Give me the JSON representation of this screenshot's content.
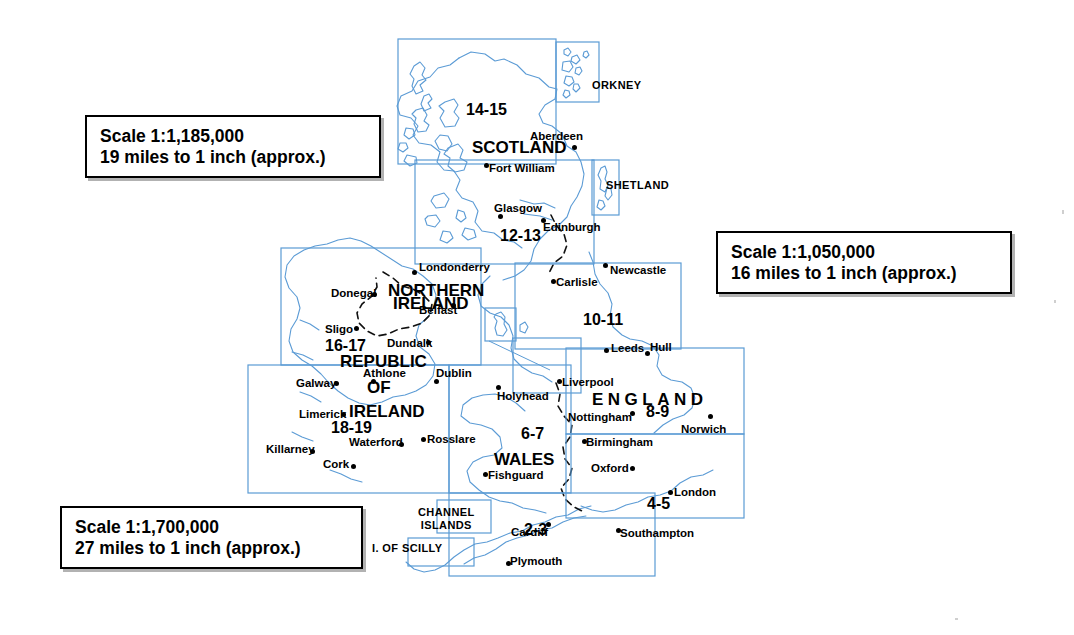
{
  "document": {
    "title": "Road Atlas Map Index — Britain and Ireland",
    "background_color": "#ffffff",
    "grid_color": "#5a9bd4",
    "coast_color": "#5b9bd5",
    "land_color": "#ffffff",
    "text_color": "#000000"
  },
  "scale_boxes": [
    {
      "name": "scale-box-scotland",
      "line1": "Scale 1:1,185,000",
      "line2": "19 miles to 1 inch (approx.)",
      "x": 85,
      "y": 115,
      "w": 296,
      "h": 63
    },
    {
      "name": "scale-box-england",
      "line1": "Scale 1:1,050,000",
      "line2": "16 miles to 1 inch (approx.)",
      "x": 716,
      "y": 231,
      "w": 296,
      "h": 63
    },
    {
      "name": "scale-box-ireland",
      "line1": "Scale 1:1,700,000",
      "line2": "27 miles to 1 inch (approx.)",
      "x": 60,
      "y": 506,
      "w": 303,
      "h": 63
    }
  ],
  "sheet_numbers": [
    {
      "label": "14-15",
      "x": 466,
      "y": 102
    },
    {
      "label": "12-13",
      "x": 500,
      "y": 228
    },
    {
      "label": "10-11",
      "x": 583,
      "y": 312
    },
    {
      "label": "16-17",
      "x": 325,
      "y": 338
    },
    {
      "label": "18-19",
      "x": 331,
      "y": 420
    },
    {
      "label": "8-9",
      "x": 646,
      "y": 404
    },
    {
      "label": "6-7",
      "x": 521,
      "y": 426
    },
    {
      "label": "4-5",
      "x": 647,
      "y": 496
    },
    {
      "label": "2-3",
      "x": 524,
      "y": 522
    }
  ],
  "country_labels": [
    {
      "label": "SCOTLAND",
      "x": 472,
      "y": 139,
      "wide": false
    },
    {
      "label": "NORTHERN",
      "x": 388,
      "y": 282,
      "wide": false
    },
    {
      "label": "IRELAND",
      "x": 393,
      "y": 295,
      "wide": false
    },
    {
      "label": "REPUBLIC",
      "x": 340,
      "y": 353,
      "wide": false
    },
    {
      "label": "OF",
      "x": 367,
      "y": 379,
      "wide": false
    },
    {
      "label": "IRELAND",
      "x": 349,
      "y": 403,
      "wide": false
    },
    {
      "label": "ENGLAND",
      "x": 592,
      "y": 391,
      "wide": true
    },
    {
      "label": "WALES",
      "x": 494,
      "y": 451,
      "wide": false
    }
  ],
  "inset_labels": [
    {
      "label": "ORKNEY",
      "x": 592,
      "y": 80,
      "lines": 1
    },
    {
      "label": "SHETLAND",
      "x": 606,
      "y": 180,
      "lines": 1
    },
    {
      "label": "CHANNEL\nISLANDS",
      "x": 418,
      "y": 506,
      "lines": 2
    },
    {
      "label": "I. OF SCILLY",
      "x": 372,
      "y": 543,
      "lines": 1
    }
  ],
  "cities": [
    {
      "name": "Aberdeen",
      "lx": 530,
      "ly": 131,
      "dx": 572,
      "dy": 145
    },
    {
      "name": "Fort William",
      "lx": 489,
      "ly": 163,
      "dx": 484,
      "dy": 163
    },
    {
      "name": "Glasgow",
      "lx": 494,
      "ly": 203,
      "dx": 498,
      "dy": 214
    },
    {
      "name": "Edinburgh",
      "lx": 543,
      "ly": 222,
      "dx": 541,
      "dy": 218
    },
    {
      "name": "Newcastle",
      "lx": 610,
      "ly": 265,
      "dx": 603,
      "dy": 263
    },
    {
      "name": "Carlisle",
      "lx": 556,
      "ly": 277,
      "dx": 551,
      "dy": 279
    },
    {
      "name": "Leeds",
      "lx": 611,
      "ly": 343,
      "dx": 604,
      "dy": 348
    },
    {
      "name": "Hull",
      "lx": 650,
      "ly": 342,
      "dx": 645,
      "dy": 351
    },
    {
      "name": "Londonderry",
      "lx": 419,
      "ly": 262,
      "dx": 412,
      "dy": 270
    },
    {
      "name": "Donegal",
      "lx": 331,
      "ly": 288,
      "dx": 372,
      "dy": 292
    },
    {
      "name": "Belfast",
      "lx": 419,
      "ly": 305,
      "dx": 451,
      "dy": 303
    },
    {
      "name": "Sligo",
      "lx": 325,
      "ly": 324,
      "dx": 354,
      "dy": 326
    },
    {
      "name": "Dundalk",
      "lx": 387,
      "ly": 338,
      "dx": 426,
      "dy": 340
    },
    {
      "name": "Athlone",
      "lx": 363,
      "ly": 368,
      "dx": 371,
      "dy": 379
    },
    {
      "name": "Dublin",
      "lx": 436,
      "ly": 368,
      "dx": 434,
      "dy": 379
    },
    {
      "name": "Galway",
      "lx": 296,
      "ly": 378,
      "dx": 334,
      "dy": 381
    },
    {
      "name": "Limerick",
      "lx": 299,
      "ly": 409,
      "dx": 341,
      "dy": 412
    },
    {
      "name": "Waterford",
      "lx": 349,
      "ly": 437,
      "dx": 399,
      "dy": 442
    },
    {
      "name": "Rosslare",
      "lx": 427,
      "ly": 434,
      "dx": 421,
      "dy": 437
    },
    {
      "name": "Killarney",
      "lx": 266,
      "ly": 444,
      "dx": 310,
      "dy": 449
    },
    {
      "name": "Cork",
      "lx": 323,
      "ly": 459,
      "dx": 351,
      "dy": 464
    },
    {
      "name": "Holyhead",
      "lx": 497,
      "ly": 391,
      "dx": 496,
      "dy": 385
    },
    {
      "name": "Liverpool",
      "lx": 562,
      "ly": 377,
      "dx": 557,
      "dy": 379
    },
    {
      "name": "Nottingham",
      "lx": 568,
      "ly": 412,
      "dx": 630,
      "dy": 411
    },
    {
      "name": "Birmingham",
      "lx": 586,
      "ly": 437,
      "dx": 582,
      "dy": 439
    },
    {
      "name": "Norwich",
      "lx": 681,
      "ly": 424,
      "dx": 708,
      "dy": 414
    },
    {
      "name": "Oxford",
      "lx": 591,
      "ly": 463,
      "dx": 630,
      "dy": 466
    },
    {
      "name": "Fishguard",
      "lx": 488,
      "ly": 470,
      "dx": 483,
      "dy": 472
    },
    {
      "name": "London",
      "lx": 674,
      "ly": 487,
      "dx": 668,
      "dy": 490
    },
    {
      "name": "Cardiff",
      "lx": 511,
      "ly": 527,
      "dx": 546,
      "dy": 522
    },
    {
      "name": "Southampton",
      "lx": 620,
      "ly": 528,
      "dx": 616,
      "dy": 528
    },
    {
      "name": "Plymouth",
      "lx": 510,
      "ly": 556,
      "dx": 506,
      "dy": 561
    }
  ],
  "grid_boxes": [
    {
      "name": "box-14-15",
      "x": 398,
      "y": 39,
      "w": 158,
      "h": 125
    },
    {
      "name": "box-orkney-inset",
      "x": 556,
      "y": 42,
      "w": 43,
      "h": 60
    },
    {
      "name": "box-12-13",
      "x": 415,
      "y": 160,
      "w": 179,
      "h": 104
    },
    {
      "name": "box-shetland-inset",
      "x": 592,
      "y": 160,
      "w": 27,
      "h": 55
    },
    {
      "name": "box-10-11",
      "x": 515,
      "y": 263,
      "w": 166,
      "h": 86
    },
    {
      "name": "box-16-17",
      "x": 281,
      "y": 248,
      "w": 200,
      "h": 117
    },
    {
      "name": "box-18-19",
      "x": 248,
      "y": 365,
      "w": 201,
      "h": 128
    },
    {
      "name": "box-iom-inset",
      "x": 485,
      "y": 308,
      "w": 31,
      "h": 33
    },
    {
      "name": "box-iom-target",
      "x": 513,
      "y": 338,
      "w": 68,
      "h": 55
    },
    {
      "name": "box-8-9",
      "x": 566,
      "y": 348,
      "w": 178,
      "h": 86
    },
    {
      "name": "box-6-7",
      "x": 449,
      "y": 365,
      "w": 122,
      "h": 128
    },
    {
      "name": "box-4-5",
      "x": 566,
      "y": 434,
      "w": 178,
      "h": 84
    },
    {
      "name": "box-2-3",
      "x": 449,
      "y": 493,
      "w": 206,
      "h": 83
    },
    {
      "name": "box-channel-islands-inset",
      "x": 437,
      "y": 500,
      "w": 54,
      "h": 33
    },
    {
      "name": "box-scilly-inset",
      "x": 408,
      "y": 538,
      "w": 66,
      "h": 28
    }
  ]
}
